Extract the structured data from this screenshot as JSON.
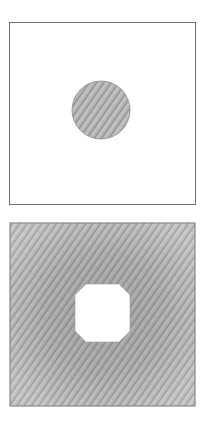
{
  "figure": {
    "colors": {
      "background": "#ffffff",
      "outline": "#6e6e6e",
      "shade_dark": "#8a8a8a",
      "shade_light": "#bdbdbd"
    },
    "panels": [
      {
        "name": "top-panel",
        "square": {
          "x": 9,
          "y": 22,
          "w": 186,
          "h": 182,
          "fill": "none"
        },
        "shape": {
          "type": "circle",
          "cx": 101,
          "cy": 110,
          "r": 29,
          "fill": "shaded"
        }
      },
      {
        "name": "bottom-panel",
        "square": {
          "x": 10,
          "y": 223,
          "w": 185,
          "h": 183,
          "fill": "shaded"
        },
        "shape": {
          "type": "octagon",
          "x": 75,
          "y": 284,
          "w": 55,
          "h": 58,
          "cut": 11,
          "fill": "white"
        }
      }
    ]
  }
}
